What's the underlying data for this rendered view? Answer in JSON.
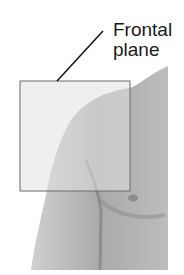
{
  "figure": {
    "label_line1": "Frontal",
    "label_line2": "plane",
    "colors": {
      "plane_fill": "#dcdcdc",
      "plane_stroke": "#6a6a6a",
      "skin_light": "#c4c4c4",
      "skin_dark": "#8e8e8e",
      "leader_line": "#111111"
    }
  }
}
